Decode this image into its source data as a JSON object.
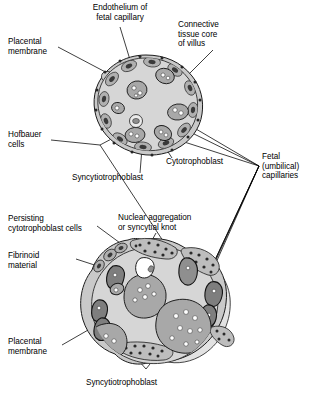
{
  "figure": {
    "background_color": "#ffffff",
    "line_color": "#000000"
  },
  "palette": {
    "core_fill": "#d6d6d6",
    "core_stroke": "#2b2b2b",
    "rim_fill": "#c9c9c9",
    "capillary_fill": "#a8a8a8",
    "capillary_stroke": "#1e1e1e",
    "nucleus_dark": "#3a3a3a",
    "rbc_white": "#ffffff",
    "halo_fill": "#ebebeb",
    "fibrinoid_fill": "#8f8f8f"
  },
  "labels": {
    "endothelium": {
      "lines": [
        "Endothelium of",
        "fetal capillary"
      ],
      "text": "Endothelium of\nfetal capillary"
    },
    "connective_tissue": {
      "lines": [
        "Connective",
        "tissue core",
        "of villus"
      ],
      "text": "Connective\ntissue core\nof villus"
    },
    "placental_membrane_top": {
      "lines": [
        "Placental",
        "membrane"
      ],
      "text": "Placental\nmembrane"
    },
    "hofbauer": {
      "lines": [
        "Hofbauer",
        "cells"
      ],
      "text": "Hofbauer\ncells"
    },
    "cytotrophoblast": {
      "lines": [
        "Cytotrophoblast"
      ],
      "text": "Cytotrophoblast"
    },
    "syncytiotrophoblast_top": {
      "lines": [
        "Syncytiotrophoblast"
      ],
      "text": "Syncytiotrophoblast"
    },
    "fetal_capillaries": {
      "lines": [
        "Fetal",
        "(umbilical)",
        "capillaries"
      ],
      "text": "Fetal\n(umbilical)\ncapillaries"
    },
    "persisting_cytotrophoblast": {
      "lines": [
        "Persisting",
        "cytotrophoblast cells"
      ],
      "text": "Persisting\ncytotrophoblast cells"
    },
    "nuclear_aggregation": {
      "lines": [
        "Nuclear aggregation",
        "or syncytial knot"
      ],
      "text": "Nuclear aggregation\nor syncytial knot"
    },
    "fibrinoid": {
      "lines": [
        "Fibrinoid",
        "material"
      ],
      "text": "Fibrinoid\nmaterial"
    },
    "placental_membrane_bottom": {
      "lines": [
        "Placental",
        "membrane"
      ],
      "text": "Placental\nmembrane"
    },
    "syncytiotrophoblast_bottom": {
      "lines": [
        "Syncytiotrophoblast"
      ],
      "text": "Syncytiotrophoblast"
    }
  },
  "structures": {
    "upper_villus": {
      "name": "early chorionic villus cross-section",
      "center_x": 146,
      "center_y": 103,
      "radius": 45
    },
    "lower_villus": {
      "name": "mature chorionic villus cross-section",
      "center_x": 150,
      "center_y": 305,
      "radius": 58
    }
  }
}
